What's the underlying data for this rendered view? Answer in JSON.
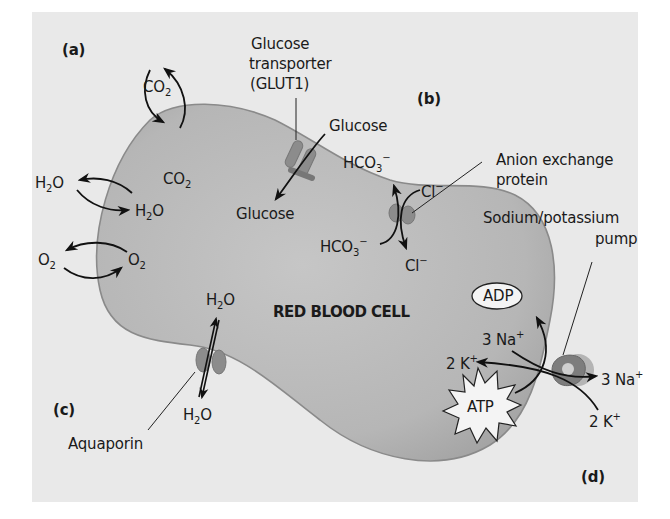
{
  "diagram": {
    "title": "RED BLOOD CELL",
    "panels": {
      "a": "(a)",
      "b": "(b)",
      "c": "(c)",
      "d": "(d)"
    },
    "panel_a": {
      "co2_outside": "CO",
      "co2_outside_sub": "2",
      "co2_inside": "CO",
      "co2_inside_sub": "2",
      "h2o_outside_pre": "H",
      "h2o_outside_sub": "2",
      "h2o_outside_post": "O",
      "h2o_inside_pre": "H",
      "h2o_inside_sub": "2",
      "h2o_inside_post": "O",
      "o2_outside": "O",
      "o2_outside_sub": "2",
      "o2_inside": "O",
      "o2_inside_sub": "2"
    },
    "glut": {
      "label_line1": "Glucose",
      "label_line2": "transporter",
      "label_line3": "(GLUT1)",
      "glucose_outside": "Glucose",
      "glucose_inside": "Glucose"
    },
    "panel_b": {
      "protein_line1": "Anion exchange",
      "protein_line2": "protein",
      "hco3_out": "HCO",
      "hco3_out_sub": "3",
      "hco3_out_sup": "−",
      "cl_in": "Cl",
      "cl_in_sup": "−",
      "hco3_in": "HCO",
      "hco3_in_sub": "3",
      "hco3_in_sup": "−",
      "cl_out": "Cl",
      "cl_out_sup": "−"
    },
    "panel_c": {
      "h2o_top_pre": "H",
      "h2o_top_sub": "2",
      "h2o_top_post": "O",
      "h2o_bottom_pre": "H",
      "h2o_bottom_sub": "2",
      "h2o_bottom_post": "O",
      "aquaporin": "Aquaporin"
    },
    "panel_d": {
      "pump_line1": "Sodium/potassium",
      "pump_line2": "pump",
      "adp": "ADP",
      "atp": "ATP",
      "na_in": "3 Na",
      "na_in_sup": "+",
      "k_in": "2 K",
      "k_in_sup": "+",
      "na_out": "3 Na",
      "na_out_sup": "+",
      "k_out": "2 K",
      "k_out_sup": "+"
    },
    "colors": {
      "background": "#e9e9e9",
      "cell_fill": "#b9b9b9",
      "membrane": "#8a8a8a",
      "protein": "#8c8c8c",
      "text": "#1a1a1a"
    }
  }
}
